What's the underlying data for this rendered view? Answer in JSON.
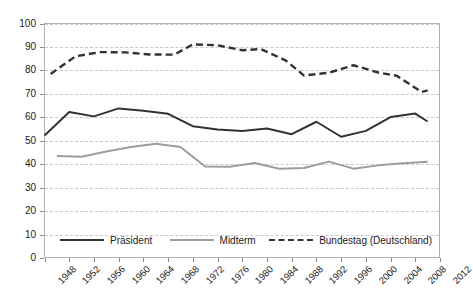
{
  "chart_data": {
    "type": "line",
    "title": "",
    "subtitle": "",
    "xlabel": "",
    "ylabel": "",
    "xlim": [
      1948,
      2012
    ],
    "ylim": [
      0,
      100
    ],
    "grid": true,
    "legend_position": "bottom-inside",
    "y_ticks": [
      0,
      10,
      20,
      30,
      40,
      50,
      60,
      70,
      80,
      90,
      100
    ],
    "x_ticks": [
      1948,
      1952,
      1956,
      1960,
      1964,
      1968,
      1972,
      1976,
      1980,
      1984,
      1988,
      1992,
      1996,
      2000,
      2004,
      2008,
      2012
    ],
    "series": [
      {
        "name": "Präsident",
        "color": "#333333",
        "style": "solid",
        "points": [
          [
            1948,
            52.2
          ],
          [
            1952,
            62.3
          ],
          [
            1956,
            60.4
          ],
          [
            1960,
            63.8
          ],
          [
            1964,
            62.8
          ],
          [
            1968,
            61.5
          ],
          [
            1972,
            56.2
          ],
          [
            1976,
            54.8
          ],
          [
            1980,
            54.2
          ],
          [
            1984,
            55.2
          ],
          [
            1988,
            52.8
          ],
          [
            1992,
            58.1
          ],
          [
            1996,
            51.7
          ],
          [
            2000,
            54.2
          ],
          [
            2004,
            60.1
          ],
          [
            2008,
            61.6
          ],
          [
            2010,
            58.2
          ]
        ]
      },
      {
        "name": "Midterm",
        "color": "#9d9d9d",
        "style": "solid",
        "points": [
          [
            1950,
            43.5
          ],
          [
            1954,
            43.2
          ],
          [
            1958,
            45.4
          ],
          [
            1962,
            47.3
          ],
          [
            1966,
            48.7
          ],
          [
            1970,
            47.3
          ],
          [
            1974,
            39.0
          ],
          [
            1978,
            38.9
          ],
          [
            1982,
            40.5
          ],
          [
            1986,
            38.1
          ],
          [
            1990,
            38.4
          ],
          [
            1994,
            41.1
          ],
          [
            1998,
            38.1
          ],
          [
            2002,
            39.5
          ],
          [
            2006,
            40.4
          ],
          [
            2010,
            41.0
          ]
        ]
      },
      {
        "name": "Bundestag (Deutschland)",
        "color": "#333333",
        "style": "dashed",
        "points": [
          [
            1949,
            78.5
          ],
          [
            1953,
            86.0
          ],
          [
            1957,
            87.8
          ],
          [
            1961,
            87.7
          ],
          [
            1965,
            86.8
          ],
          [
            1969,
            86.7
          ],
          [
            1972,
            91.1
          ],
          [
            1976,
            90.7
          ],
          [
            1980,
            88.6
          ],
          [
            1983,
            89.1
          ],
          [
            1987,
            84.3
          ],
          [
            1990,
            77.8
          ],
          [
            1994,
            79.0
          ],
          [
            1998,
            82.2
          ],
          [
            2002,
            79.1
          ],
          [
            2005,
            77.7
          ],
          [
            2009,
            70.8
          ],
          [
            2010,
            71.5
          ]
        ]
      }
    ],
    "legend": [
      {
        "label": "Präsident",
        "color": "#333333",
        "style": "solid"
      },
      {
        "label": "Midterm",
        "color": "#9d9d9d",
        "style": "solid"
      },
      {
        "label": "Bundestag (Deutschland)",
        "color": "#333333",
        "style": "dashed"
      }
    ]
  }
}
